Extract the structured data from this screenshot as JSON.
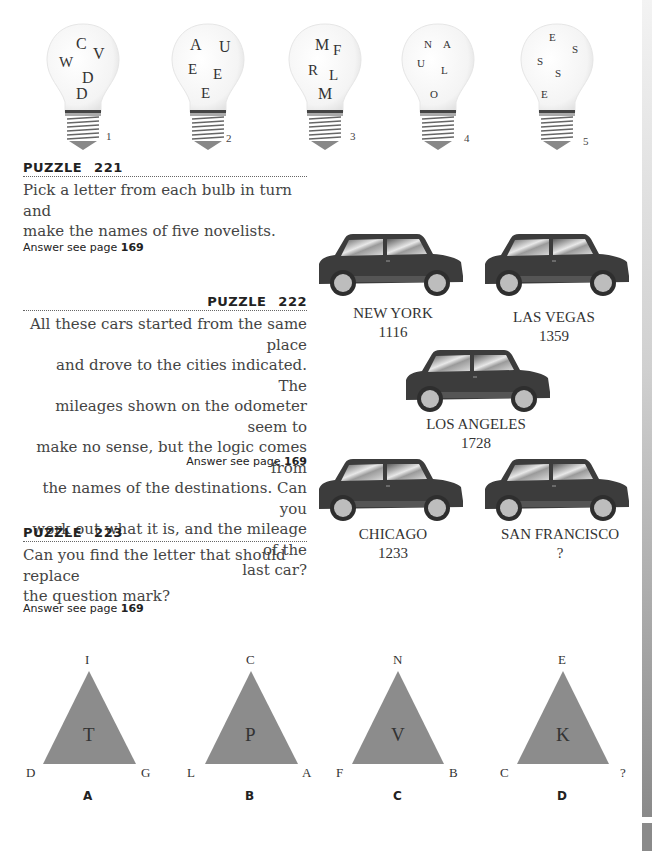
{
  "puzzle221": {
    "heading": "PUZZLE",
    "number": "221",
    "text_line1": "Pick a letter from each bulb in turn and",
    "text_line2": "make the names of five novelists.",
    "answer_prefix": "Answer see page",
    "answer_page": "169",
    "bulbs": [
      {
        "number": "1",
        "letters": [
          "C",
          "V",
          "W",
          "D",
          "D"
        ]
      },
      {
        "number": "2",
        "letters": [
          "A",
          "U",
          "E",
          "E",
          "E"
        ]
      },
      {
        "number": "3",
        "letters": [
          "M",
          "F",
          "R",
          "L",
          "M"
        ]
      },
      {
        "number": "4",
        "letters": [
          "N",
          "A",
          "U",
          "L",
          "O"
        ]
      },
      {
        "number": "5",
        "letters": [
          "E",
          "S",
          "S",
          "S",
          "E"
        ]
      }
    ]
  },
  "puzzle222": {
    "heading": "PUZZLE",
    "number": "222",
    "lines": [
      "All these cars started from the same place",
      "and drove to the cities indicated. The",
      "mileages shown on the odometer seem to",
      "make no sense, but the logic comes from",
      "the names of the destinations. Can you",
      "work out what it is, and the mileage of the",
      "last car?"
    ],
    "answer_prefix": "Answer see page",
    "answer_page": "169",
    "cars": [
      {
        "city": "NEW YORK",
        "mileage": "1116"
      },
      {
        "city": "LAS VEGAS",
        "mileage": "1359"
      },
      {
        "city": "LOS ANGELES",
        "mileage": "1728"
      },
      {
        "city": "CHICAGO",
        "mileage": "1233"
      },
      {
        "city": "SAN FRANCISCO",
        "mileage": "?"
      }
    ]
  },
  "puzzle223": {
    "heading": "PUZZLE",
    "number": "223",
    "text_line1": "Can you find the letter that should replace",
    "text_line2": "the question mark?",
    "answer_prefix": "Answer see page",
    "answer_page": "169",
    "triangles": [
      {
        "label": "A",
        "apex": "I",
        "left": "D",
        "right": "G",
        "center": "T"
      },
      {
        "label": "B",
        "apex": "C",
        "left": "L",
        "right": "A",
        "center": "P"
      },
      {
        "label": "C",
        "apex": "N",
        "left": "F",
        "right": "B",
        "center": "V"
      },
      {
        "label": "D",
        "apex": "E",
        "left": "C",
        "right": "?",
        "center": "K"
      }
    ],
    "triangle_color": "#8c8c8c"
  }
}
